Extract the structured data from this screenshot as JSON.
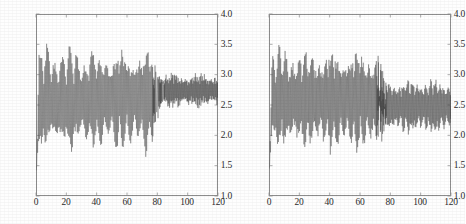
{
  "figure": {
    "background_color": "#fefefe",
    "line_color": "#3a3a3a",
    "axis_color": "#8d8d8d"
  },
  "chart_data": [
    {
      "type": "line",
      "panel": "left",
      "title": "",
      "xlabel": "",
      "ylabel": "",
      "xlim": [
        0,
        120
      ],
      "ylim": [
        1.0,
        4.0
      ],
      "grid": false,
      "legend": null,
      "xticks": [
        0,
        20,
        40,
        60,
        80,
        100,
        120
      ],
      "xtick_labels": [
        "0",
        "20",
        "40",
        "60",
        "80",
        "100",
        "120"
      ],
      "yticks": [
        1.0,
        1.5,
        2.0,
        2.5,
        3.0,
        3.5,
        4.0
      ],
      "ytick_labels": [
        "1.0",
        "1.5",
        "2.0",
        "2.5",
        "3.0",
        "3.5",
        "4.0"
      ],
      "description": "Dense high-frequency oscillating series; large amplitude swings between about 1.65 and 3.55 for x from 0 to about 85, then a regime change to a tighter, higher-frequency band between about 2.40 and 3.05 for x from 85 to 120. Series begins near 1.42 at x = 0.",
      "series": [
        {
          "name": "series-1",
          "n_points": 1200,
          "x_start": 0,
          "x_end": 120,
          "start_value": 1.42,
          "segments": [
            {
              "x_range": [
                0,
                85
              ],
              "center": 2.58,
              "envelope_low": 1.66,
              "envelope_high": 3.52,
              "carrier_period": 5.0,
              "ripple_period": 0.62
            },
            {
              "x_range": [
                85,
                120
              ],
              "center": 2.74,
              "envelope_low": 2.41,
              "envelope_high": 3.06,
              "carrier_period": 1.15,
              "ripple_period": 0.42
            }
          ]
        }
      ]
    },
    {
      "type": "line",
      "panel": "right",
      "title": "",
      "xlabel": "",
      "ylabel": "",
      "xlim": [
        0,
        120
      ],
      "ylim": [
        1.0,
        4.0
      ],
      "grid": false,
      "legend": null,
      "xticks": [
        0,
        20,
        40,
        60,
        80,
        100,
        120
      ],
      "xtick_labels": [
        "0",
        "20",
        "40",
        "60",
        "80",
        "100",
        "120"
      ],
      "yticks": [
        1.0,
        1.5,
        2.0,
        2.5,
        3.0,
        3.5,
        4.0
      ],
      "ytick_labels": [
        "1.0",
        "1.5",
        "2.0",
        "2.5",
        "3.0",
        "3.5",
        "4.0"
      ],
      "description": "Dense high-frequency oscillating series starting near 1.45 at x = 0, rising quickly into a wide band roughly 1.68 to 3.52 for x up to about 78, then the amplitude gradually decays to roughly 1.95 to 3.00 by x = 120.",
      "series": [
        {
          "name": "series-1",
          "n_points": 1200,
          "x_start": 0,
          "x_end": 120,
          "start_value": 1.45,
          "segments": [
            {
              "x_range": [
                0,
                78
              ],
              "center": 2.57,
              "envelope_low": 1.68,
              "envelope_high": 3.52,
              "carrier_period": 4.3,
              "ripple_period": 0.58
            },
            {
              "x_range": [
                78,
                120
              ],
              "center": 2.48,
              "envelope_low": 1.95,
              "envelope_high": 3.0,
              "carrier_period": 3.0,
              "ripple_period": 0.5
            }
          ]
        }
      ]
    }
  ]
}
